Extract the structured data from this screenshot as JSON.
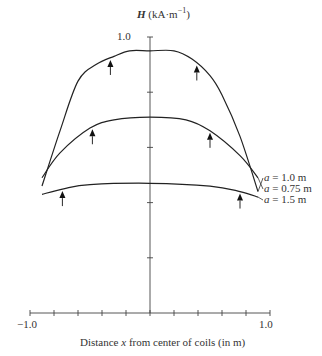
{
  "chart_data": {
    "type": "line",
    "title": "",
    "xlabel": "Distance x from center of coils (in m)",
    "ylabel": "H (kA·m⁻¹)",
    "xlim": [
      -1.0,
      1.0
    ],
    "ylim": [
      0,
      1.0
    ],
    "x_tick_labels": [
      "-1.0",
      "1.0"
    ],
    "y_tick_labels": [
      "1.0"
    ],
    "x_tick_step": 0.2,
    "y_tick_step": 0.2,
    "grid": false,
    "legend_position": "right, inline labels",
    "annotations": "Arrows mark coil positions on each curve",
    "series": [
      {
        "name": "a = 1.0 m",
        "x": [
          -0.9,
          -0.75,
          -0.6,
          -0.45,
          -0.3,
          -0.17,
          0.0,
          0.2,
          0.35,
          0.5,
          0.6,
          0.75,
          0.9
        ],
        "y": [
          0.46,
          0.66,
          0.84,
          0.9,
          0.93,
          0.95,
          0.95,
          0.95,
          0.92,
          0.86,
          0.79,
          0.64,
          0.44
        ],
        "arrows_at": [
          -0.33,
          0.39
        ]
      },
      {
        "name": "a = 0.75 m",
        "x": [
          -0.9,
          -0.75,
          -0.5,
          -0.3,
          0.0,
          0.3,
          0.5,
          0.75,
          0.9
        ],
        "y": [
          0.49,
          0.58,
          0.67,
          0.7,
          0.71,
          0.7,
          0.66,
          0.57,
          0.49
        ],
        "arrows_at": [
          -0.48,
          0.5
        ]
      },
      {
        "name": "a = 1.5 m",
        "x": [
          -0.9,
          -0.72,
          -0.5,
          0.0,
          0.5,
          0.75,
          0.9
        ],
        "y": [
          0.43,
          0.45,
          0.465,
          0.47,
          0.46,
          0.44,
          0.42
        ],
        "arrows_at": [
          -0.73,
          0.75
        ]
      }
    ]
  },
  "labels": {
    "ylabel_symbol": "H",
    "ylabel_unit": "(kA·m",
    "ylabel_exp": "−1",
    "ylabel_close": ")",
    "ytick_top": "1.0",
    "xtick_min": "−1.0",
    "xtick_max": "1.0",
    "xlabel_pre": "Distance ",
    "xlabel_var": "x",
    "xlabel_post": " from center of coils (in m)",
    "legend": [
      {
        "sym": "a",
        "text": " = 1.0 m"
      },
      {
        "sym": "a",
        "text": " = 0.75 m"
      },
      {
        "sym": "a",
        "text": " = 1.5 m"
      }
    ]
  }
}
